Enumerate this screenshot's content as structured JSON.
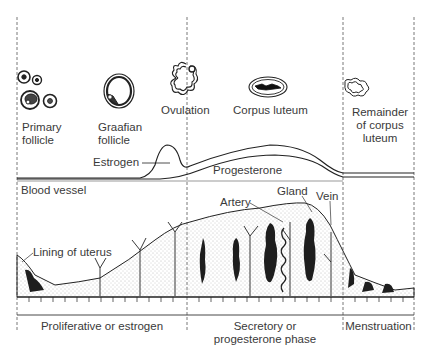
{
  "ovary_stages": [
    {
      "id": "primary-follicle",
      "label_line1": "Primary",
      "label_line2": "follicle"
    },
    {
      "id": "graafian-follicle",
      "label_line1": "Graafian",
      "label_line2": "follicle"
    },
    {
      "id": "ovulation",
      "label_line1": "Ovulation"
    },
    {
      "id": "corpus-luteum",
      "label_line1": "Corpus luteum"
    },
    {
      "id": "remainder-corpus-luteum",
      "label_line1": "Remainder",
      "label_line2": "of corpus",
      "label_line3": "luteum"
    }
  ],
  "hormones": {
    "estrogen": "Estrogen",
    "progesterone": "Progesterone"
  },
  "uterus_labels": {
    "blood_vessel": "Blood vessel",
    "lining": "Lining of uterus",
    "artery": "Artery",
    "gland": "Gland",
    "vein": "Vein"
  },
  "phases": [
    {
      "label_line1": "Proliferative or estrogen"
    },
    {
      "label_line1": "Secretory or",
      "label_line2": "progesterone phase"
    },
    {
      "label_line1": "Menstruation"
    }
  ],
  "colors": {
    "line": "#2a2a2a",
    "text": "#3a3a3a",
    "stipple": "#9a9a9a",
    "dark_tissue": "#1e1e1e",
    "background": "#ffffff"
  }
}
